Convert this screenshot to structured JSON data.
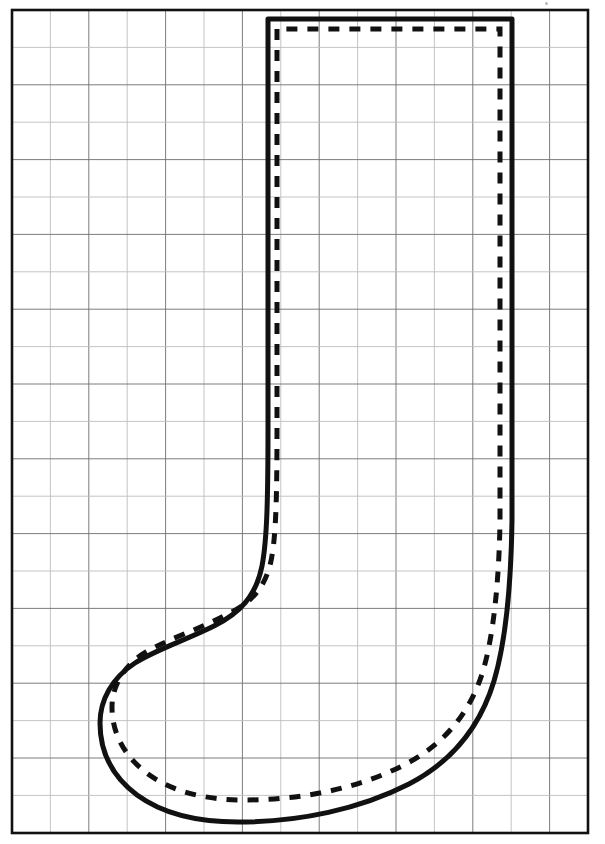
{
  "document": {
    "title": "Christmas Stocking Sewing Pattern",
    "type": "grid-pattern-template",
    "background_color": "#ffffff",
    "ink_color": "#111111",
    "grid_line_color": "#6e6e6e",
    "grid_minor_color": "#bdbdbd"
  },
  "canvas": {
    "width": 605,
    "height": 844
  },
  "grid": {
    "name": "scaling-grid",
    "description": "Square ruled grid used to scale the stocking pattern",
    "border": {
      "x": 12,
      "y": 10,
      "width": 576,
      "height": 823,
      "stroke_width": 2.6
    },
    "cell_width": 38.4,
    "cell_height": 37.4,
    "columns": 15,
    "rows": 22,
    "minor_line_width": 0.9,
    "major_line_width": 0.9,
    "x_lines": [
      12,
      50.4,
      88.8,
      127.2,
      165.6,
      204,
      242.4,
      280.8,
      319.2,
      357.6,
      396,
      434.4,
      472.8,
      511.2,
      549.6,
      588
    ],
    "y_lines": [
      10,
      47.4,
      84.8,
      122.2,
      159.6,
      197,
      234.4,
      271.8,
      309.2,
      346.6,
      384,
      421.4,
      458.8,
      496.2,
      533.6,
      571,
      608.4,
      645.8,
      683.2,
      720.6,
      758,
      795.4,
      833
    ]
  },
  "shapes": {
    "cut_line": {
      "name": "stocking-cut-line",
      "style": "solid",
      "stroke_width": 5.0,
      "color": "#111111",
      "path": "M 268 19 L 268 425 C 268 500 267 540 262 566 C 256 596 240 613 214 626 C 186 640 155 650 135 663 C 112 678 100 700 100 723 C 100 752 113 777 137 795 C 163 814 198 822 238 822 C 300 822 360 809 409 784 C 455 760 481 724 494 681 C 505 644 511 588 512 520 L 512 19 Z"
    },
    "stitch_line": {
      "name": "stocking-stitch-line",
      "style": "dashed",
      "stroke_width": 5.0,
      "color": "#111111",
      "dash_pattern": "11 10",
      "path": "M 277 29 L 277 426 C 277 498 276 537 271 561 C 265 589 250 604 224 616 C 197 630 166 640 146 652 C 124 665 112 686 112 707 C 112 734 125 757 148 774 C 173 792 206 800 244 800 C 303 800 359 788 404 765 C 447 743 471 710 483 671 C 493 637 499 585 500 521 L 500 29 Z"
    }
  },
  "artifacts": {
    "top_speck": {
      "x": 545,
      "y": 2,
      "size": 3
    }
  }
}
